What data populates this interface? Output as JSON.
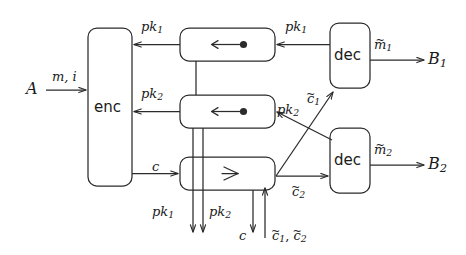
{
  "diagram": {
    "type": "block-dataflow-diagram",
    "stroke_color": "#2b2b2b",
    "background": "#ffffff",
    "nodes": [
      {
        "id": "A",
        "label": "A",
        "kind": "terminal",
        "x": 30,
        "y": 88
      },
      {
        "id": "enc",
        "label": "enc",
        "kind": "process",
        "x": 88,
        "y": 28,
        "w": 44,
        "h": 158
      },
      {
        "id": "buf1",
        "label": "←•",
        "kind": "register",
        "x": 180,
        "y": 28,
        "w": 95,
        "h": 33
      },
      {
        "id": "buf2",
        "label": "←•",
        "kind": "register",
        "x": 180,
        "y": 95,
        "w": 95,
        "h": 33
      },
      {
        "id": "split",
        "label": "≺",
        "kind": "splitter",
        "x": 180,
        "y": 157,
        "w": 95,
        "h": 33
      },
      {
        "id": "dec1",
        "label": "dec",
        "kind": "process",
        "x": 330,
        "y": 23,
        "w": 40,
        "h": 65
      },
      {
        "id": "dec2",
        "label": "dec",
        "kind": "process",
        "x": 330,
        "y": 128,
        "w": 40,
        "h": 65
      },
      {
        "id": "B1",
        "label": "B",
        "sub": "1",
        "kind": "terminal",
        "x": 432,
        "y": 60
      },
      {
        "id": "B2",
        "label": "B",
        "sub": "2",
        "kind": "terminal",
        "x": 432,
        "y": 165
      }
    ],
    "edge_labels": {
      "a_to_enc": {
        "base": "m, i",
        "sub": ""
      },
      "buf1_to_enc": {
        "base": "pk",
        "sub": "1"
      },
      "buf2_to_enc": {
        "base": "pk",
        "sub": "2"
      },
      "dec1_to_buf1": {
        "base": "pk",
        "sub": "1"
      },
      "dec2_to_buf2": {
        "base": "pk",
        "sub": "2"
      },
      "enc_to_split": {
        "base": "c",
        "sub": ""
      },
      "split_to_dec1": {
        "base": "c",
        "sub": "1",
        "tilde": true
      },
      "split_to_dec2": {
        "base": "c",
        "sub": "2",
        "tilde": true
      },
      "dec1_out": {
        "base": "m",
        "sub": "1",
        "tilde": true
      },
      "dec2_out": {
        "base": "m",
        "sub": "2",
        "tilde": true
      },
      "bottom_pk1": {
        "base": "pk",
        "sub": "1"
      },
      "bottom_pk2": {
        "base": "pk",
        "sub": "2"
      },
      "bottom_c": {
        "base": "c",
        "sub": ""
      },
      "bottom_ctilde": {
        "base": "c1c2",
        "sub": ""
      }
    }
  }
}
